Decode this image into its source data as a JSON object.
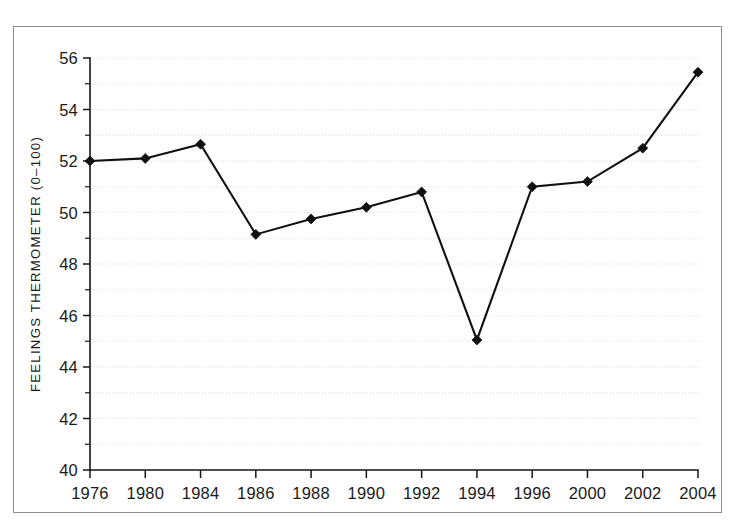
{
  "figure": {
    "frame_color": "#8d8d8d",
    "background": "#ffffff"
  },
  "axes": {
    "y_title": "FEELINGS THERMOMETER (0–100)",
    "x_title": "",
    "y_ticks": [
      "40",
      "42",
      "44",
      "46",
      "48",
      "50",
      "52",
      "54",
      "56"
    ],
    "x_ticks": [
      "1976",
      "1980",
      "1984",
      "1986",
      "1988",
      "1990",
      "1992",
      "1994",
      "1996",
      "2000",
      "2002",
      "2004"
    ]
  },
  "chart_data": {
    "type": "line",
    "title": "",
    "xlabel": "",
    "ylabel": "FEELINGS THERMOMETER (0–100)",
    "categories": [
      "1976",
      "1980",
      "1984",
      "1986",
      "1988",
      "1990",
      "1992",
      "1994",
      "1996",
      "2000",
      "2002",
      "2004"
    ],
    "values": [
      52.0,
      52.1,
      52.65,
      49.15,
      49.75,
      50.2,
      50.8,
      45.05,
      51.0,
      51.2,
      52.5,
      55.45
    ],
    "ylim": [
      40,
      56
    ],
    "y_major_step": 2,
    "y_minor_step": 1,
    "grid": true,
    "grid_axis": "y",
    "grid_color": "#c9cfe0",
    "legend": "none",
    "line_color": "#101010",
    "marker": "diamond",
    "marker_color": "#101010"
  }
}
